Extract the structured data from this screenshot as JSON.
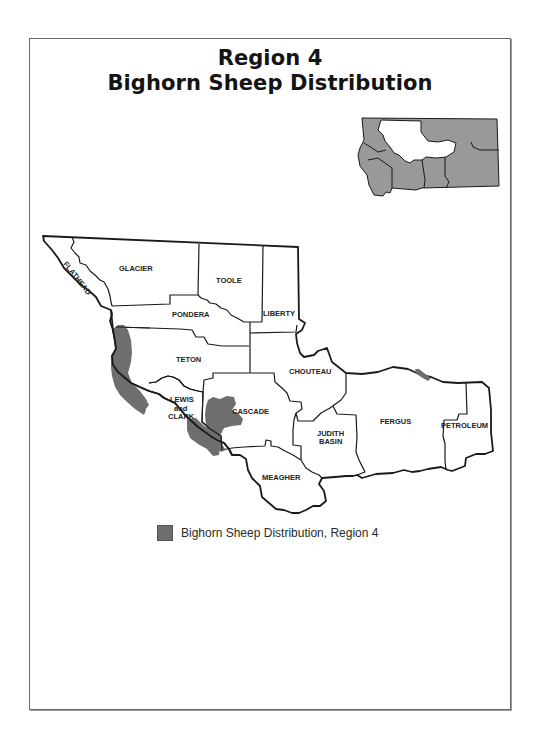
{
  "title": {
    "line1": "Region 4",
    "line2": "Bighorn Sheep Distribution"
  },
  "colors": {
    "distribution_fill": "#6e6e6e",
    "inset_fill": "#999999",
    "county_stroke": "#1a1a1a",
    "background": "#ffffff"
  },
  "map": {
    "counties": [
      {
        "id": "flathead",
        "label": "FLATHEAD"
      },
      {
        "id": "glacier",
        "label": "GLACIER"
      },
      {
        "id": "toole",
        "label": "TOOLE"
      },
      {
        "id": "liberty",
        "label": "LIBERTY"
      },
      {
        "id": "pondera",
        "label": "PONDERA"
      },
      {
        "id": "teton",
        "label": "TETON"
      },
      {
        "id": "chouteau",
        "label": "CHOUTEAU"
      },
      {
        "id": "lewis-and-clark",
        "label_line1": "LEWIS",
        "label_line2": "and",
        "label_line3": "CLARK"
      },
      {
        "id": "cascade",
        "label": "CASCADE"
      },
      {
        "id": "judith-basin",
        "label_line1": "JUDITH",
        "label_line2": "BASIN"
      },
      {
        "id": "fergus",
        "label": "FERGUS"
      },
      {
        "id": "petroleum",
        "label": "PETROLEUM"
      },
      {
        "id": "meagher",
        "label": "MEAGHER"
      }
    ]
  },
  "inset": {
    "description": "Montana state outline with Region 4 highlighted in white"
  },
  "legend": {
    "label": "Bighorn Sheep Distribution, Region 4"
  }
}
